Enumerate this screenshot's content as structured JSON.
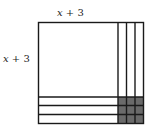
{
  "diagram": {
    "top_label": "x + 3",
    "side_label": "x + 3",
    "square": {
      "x": 38,
      "y": 22,
      "size": 106
    },
    "strip_width": 8.5,
    "unit_count": 3,
    "colors": {
      "line": "#1a1a1a",
      "unit_fill": "#6a6a6a",
      "background": "#ffffff"
    }
  }
}
